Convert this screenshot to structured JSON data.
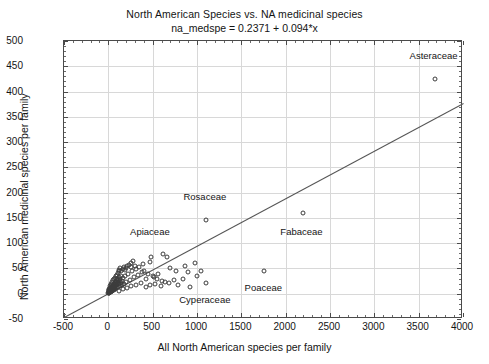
{
  "chart_data": {
    "type": "scatter",
    "title": "North American Species vs. NA medicinal species",
    "subtitle": "na_medspe = 0.2371 + 0.094*x",
    "xlabel": "All North American species per family",
    "ylabel": "North American medicinal species per family",
    "xlim": [
      -500,
      4000
    ],
    "ylim": [
      -50,
      500
    ],
    "xticks": [
      -500,
      0,
      500,
      1000,
      1500,
      2000,
      2500,
      3000,
      3500,
      4000
    ],
    "yticks": [
      -50,
      0,
      50,
      100,
      150,
      200,
      250,
      300,
      350,
      400,
      450,
      500
    ],
    "grid": true,
    "legend": "none",
    "marker_style": "open-circle",
    "fit": {
      "intercept": 0.2371,
      "slope": 0.094,
      "equation": "na_medspe = 0.2371 + 0.094*x",
      "x_start": -500,
      "x_end": 4000,
      "y_start": -46.8,
      "y_end": 376.2
    },
    "annotations": [
      {
        "label": "Asteraceae",
        "x": 3680,
        "y": 425,
        "label_dx": 0,
        "label_dy": 22
      },
      {
        "label": "Rosaceae",
        "x": 1100,
        "y": 145,
        "label_dx": 0,
        "label_dy": 22
      },
      {
        "label": "Fabaceae",
        "x": 2190,
        "y": 160,
        "label_dx": 0,
        "label_dy": -20
      },
      {
        "label": "Apiaceae",
        "x": 480,
        "y": 72,
        "label_dx": 0,
        "label_dy": 24
      },
      {
        "label": "Poaceae",
        "x": 1760,
        "y": 45,
        "label_dx": 0,
        "label_dy": -18
      },
      {
        "label": "Cyperaceae",
        "x": 1100,
        "y": 22,
        "label_dx": 0,
        "label_dy": -18
      }
    ],
    "points": [
      [
        3680,
        425
      ],
      [
        2190,
        160
      ],
      [
        1100,
        145
      ],
      [
        1760,
        45
      ],
      [
        1100,
        22
      ],
      [
        480,
        72
      ],
      [
        470,
        62
      ],
      [
        390,
        58
      ],
      [
        300,
        55
      ],
      [
        250,
        52
      ],
      [
        620,
        78
      ],
      [
        660,
        72
      ],
      [
        700,
        50
      ],
      [
        760,
        45
      ],
      [
        860,
        55
      ],
      [
        900,
        42
      ],
      [
        1000,
        36
      ],
      [
        980,
        60
      ],
      [
        840,
        30
      ],
      [
        560,
        40
      ],
      [
        520,
        34
      ],
      [
        600,
        26
      ],
      [
        430,
        30
      ],
      [
        380,
        42
      ],
      [
        330,
        38
      ],
      [
        290,
        33
      ],
      [
        270,
        45
      ],
      [
        240,
        28
      ],
      [
        220,
        40
      ],
      [
        200,
        24
      ],
      [
        190,
        36
      ],
      [
        175,
        20
      ],
      [
        165,
        31
      ],
      [
        155,
        26
      ],
      [
        150,
        18
      ],
      [
        145,
        35
      ],
      [
        140,
        22
      ],
      [
        135,
        29
      ],
      [
        130,
        16
      ],
      [
        126,
        25
      ],
      [
        122,
        33
      ],
      [
        118,
        19
      ],
      [
        114,
        27
      ],
      [
        110,
        14
      ],
      [
        106,
        23
      ],
      [
        102,
        30
      ],
      [
        98,
        17
      ],
      [
        95,
        21
      ],
      [
        92,
        12
      ],
      [
        89,
        26
      ],
      [
        86,
        18
      ],
      [
        83,
        24
      ],
      [
        80,
        10
      ],
      [
        78,
        15
      ],
      [
        75,
        20
      ],
      [
        72,
        13
      ],
      [
        70,
        22
      ],
      [
        68,
        9
      ],
      [
        66,
        17
      ],
      [
        64,
        11
      ],
      [
        62,
        19
      ],
      [
        60,
        8
      ],
      [
        58,
        14
      ],
      [
        56,
        10
      ],
      [
        54,
        16
      ],
      [
        52,
        7
      ],
      [
        50,
        12
      ],
      [
        48,
        9
      ],
      [
        46,
        15
      ],
      [
        44,
        6
      ],
      [
        42,
        11
      ],
      [
        40,
        8
      ],
      [
        38,
        13
      ],
      [
        36,
        5
      ],
      [
        34,
        10
      ],
      [
        32,
        7
      ],
      [
        30,
        12
      ],
      [
        28,
        4
      ],
      [
        26,
        9
      ],
      [
        24,
        6
      ],
      [
        22,
        11
      ],
      [
        20,
        3
      ],
      [
        18,
        8
      ],
      [
        16,
        5
      ],
      [
        14,
        10
      ],
      [
        12,
        2
      ],
      [
        10,
        7
      ],
      [
        9,
        4
      ],
      [
        8,
        9
      ],
      [
        7,
        1
      ],
      [
        6,
        6
      ],
      [
        5,
        3
      ],
      [
        4,
        8
      ],
      [
        3,
        2
      ],
      [
        2,
        5
      ],
      [
        1,
        1
      ],
      [
        15,
        16
      ],
      [
        25,
        18
      ],
      [
        35,
        20
      ],
      [
        45,
        24
      ],
      [
        55,
        28
      ],
      [
        65,
        30
      ],
      [
        75,
        32
      ],
      [
        85,
        36
      ],
      [
        95,
        38
      ],
      [
        105,
        41
      ],
      [
        115,
        44
      ],
      [
        125,
        47
      ],
      [
        135,
        50
      ],
      [
        148,
        44
      ],
      [
        160,
        48
      ],
      [
        172,
        52
      ],
      [
        185,
        46
      ],
      [
        198,
        50
      ],
      [
        210,
        54
      ],
      [
        230,
        56
      ],
      [
        255,
        60
      ],
      [
        280,
        64
      ],
      [
        310,
        48
      ],
      [
        350,
        52
      ],
      [
        400,
        44
      ],
      [
        450,
        40
      ],
      [
        500,
        36
      ],
      [
        550,
        30
      ],
      [
        640,
        24
      ],
      [
        740,
        28
      ],
      [
        120,
        6
      ],
      [
        160,
        9
      ],
      [
        205,
        12
      ],
      [
        260,
        15
      ],
      [
        315,
        18
      ],
      [
        370,
        21
      ],
      [
        420,
        14
      ],
      [
        470,
        17
      ],
      [
        530,
        20
      ],
      [
        590,
        16
      ],
      [
        680,
        22
      ],
      [
        790,
        18
      ],
      [
        920,
        14
      ],
      [
        1050,
        44
      ]
    ]
  }
}
